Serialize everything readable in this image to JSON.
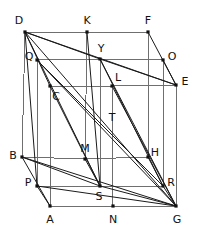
{
  "figure": {
    "type": "geometry-diagram",
    "width": 197,
    "height": 247,
    "background_color": "#ffffff",
    "edge_color": "#6f6f6f",
    "diagonal_color": "#1a1a1a",
    "vertex_color": "#111111",
    "label_color": "#111111",
    "label_font_size": 11
  },
  "points": [
    {
      "id": "D",
      "label": "D",
      "x": 25,
      "y": 32,
      "lx": 19,
      "ly": 20,
      "dot": true
    },
    {
      "id": "K",
      "label": "K",
      "x": 87,
      "y": 32,
      "lx": 87,
      "ly": 20,
      "dot": true
    },
    {
      "id": "F",
      "label": "F",
      "x": 148,
      "y": 32,
      "lx": 148,
      "ly": 20,
      "dot": true
    },
    {
      "id": "Q",
      "label": "Q",
      "x": 37,
      "y": 60,
      "lx": 29,
      "ly": 56,
      "dot": true
    },
    {
      "id": "Y",
      "label": "Y",
      "x": 100,
      "y": 59,
      "lx": 101,
      "ly": 48,
      "dot": true
    },
    {
      "id": "O",
      "label": "O",
      "x": 163,
      "y": 60,
      "lx": 172,
      "ly": 56,
      "dot": true
    },
    {
      "id": "C",
      "label": "C",
      "x": 50,
      "y": 86,
      "lx": 56,
      "ly": 96,
      "dot": true
    },
    {
      "id": "L",
      "label": "L",
      "x": 112,
      "y": 86,
      "lx": 118,
      "ly": 77,
      "dot": true
    },
    {
      "id": "E",
      "label": "E",
      "x": 176,
      "y": 85,
      "lx": 185,
      "ly": 81,
      "dot": true
    },
    {
      "id": "T",
      "label": "T",
      "x": 112,
      "y": 117,
      "lx": 112,
      "ly": 117,
      "dot": false
    },
    {
      "id": "B",
      "label": "B",
      "x": 22,
      "y": 157,
      "lx": 13,
      "ly": 155,
      "dot": true
    },
    {
      "id": "M",
      "label": "M",
      "x": 85,
      "y": 159,
      "lx": 85,
      "ly": 148,
      "dot": true
    },
    {
      "id": "H",
      "label": "H",
      "x": 148,
      "y": 157,
      "lx": 155,
      "ly": 152,
      "dot": true
    },
    {
      "id": "P",
      "label": "P",
      "x": 37,
      "y": 186,
      "lx": 28,
      "ly": 182,
      "dot": true
    },
    {
      "id": "S",
      "label": "S",
      "x": 100,
      "y": 186,
      "lx": 99,
      "ly": 196,
      "dot": true
    },
    {
      "id": "R",
      "label": "R",
      "x": 163,
      "y": 186,
      "lx": 171,
      "ly": 182,
      "dot": true
    },
    {
      "id": "A",
      "label": "A",
      "x": 50,
      "y": 206,
      "lx": 50,
      "ly": 219,
      "dot": true
    },
    {
      "id": "N",
      "label": "N",
      "x": 113,
      "y": 206,
      "lx": 113,
      "ly": 219,
      "dot": true
    },
    {
      "id": "G",
      "label": "G",
      "x": 176,
      "y": 206,
      "lx": 177,
      "ly": 219,
      "dot": true
    }
  ],
  "edges": [
    {
      "from": "D",
      "to": "K"
    },
    {
      "from": "K",
      "to": "F"
    },
    {
      "from": "Q",
      "to": "Y"
    },
    {
      "from": "Y",
      "to": "O"
    },
    {
      "from": "C",
      "to": "L"
    },
    {
      "from": "L",
      "to": "E"
    },
    {
      "from": "B",
      "to": "M"
    },
    {
      "from": "M",
      "to": "H"
    },
    {
      "from": "P",
      "to": "S"
    },
    {
      "from": "S",
      "to": "R"
    },
    {
      "from": "A",
      "to": "N"
    },
    {
      "from": "N",
      "to": "G"
    },
    {
      "from": "D",
      "to": "B"
    },
    {
      "from": "Q",
      "to": "P"
    },
    {
      "from": "C",
      "to": "A"
    },
    {
      "from": "K",
      "to": "M"
    },
    {
      "from": "Y",
      "to": "S"
    },
    {
      "from": "L",
      "to": "N"
    },
    {
      "from": "F",
      "to": "H"
    },
    {
      "from": "O",
      "to": "R"
    },
    {
      "from": "E",
      "to": "G"
    }
  ],
  "diagonals": [
    {
      "from": "D",
      "to": "Y"
    },
    {
      "from": "D",
      "to": "E"
    },
    {
      "from": "D",
      "to": "S"
    },
    {
      "from": "D",
      "to": "G"
    },
    {
      "from": "D",
      "to": "C"
    },
    {
      "from": "D",
      "to": "P"
    },
    {
      "from": "Q",
      "to": "R"
    },
    {
      "from": "Q",
      "to": "G"
    },
    {
      "from": "Y",
      "to": "E"
    },
    {
      "from": "Y",
      "to": "G"
    },
    {
      "from": "Y",
      "to": "R"
    },
    {
      "from": "K",
      "to": "S"
    },
    {
      "from": "F",
      "to": "E"
    },
    {
      "from": "O",
      "to": "E"
    },
    {
      "from": "B",
      "to": "S"
    },
    {
      "from": "B",
      "to": "G"
    },
    {
      "from": "B",
      "to": "A"
    },
    {
      "from": "P",
      "to": "A"
    },
    {
      "from": "P",
      "to": "G"
    },
    {
      "from": "S",
      "to": "G"
    },
    {
      "from": "M",
      "to": "S"
    },
    {
      "from": "H",
      "to": "R"
    },
    {
      "from": "R",
      "to": "G"
    },
    {
      "from": "L",
      "to": "G"
    },
    {
      "from": "C",
      "to": "S"
    }
  ]
}
